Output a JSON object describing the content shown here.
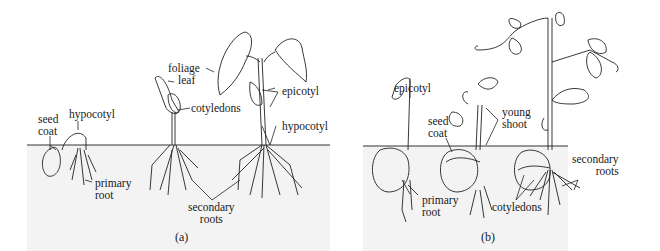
{
  "figure": {
    "panel_a": {
      "caption": "(a)",
      "labels": {
        "seed_coat_1": "seed",
        "seed_coat_2": "coat",
        "hypocotyl_1": "hypocotyl",
        "primary_root_1": "primary",
        "primary_root_2": "root",
        "foliage_leaf_1": "foliage",
        "foliage_leaf_2": "leaf",
        "cotyledons": "cotyledons",
        "epicotyl": "epicotyl",
        "hypocotyl_2": "hypocotyl",
        "secondary_roots_1": "secondary",
        "secondary_roots_2": "roots"
      }
    },
    "panel_b": {
      "caption": "(b)",
      "labels": {
        "epicotyl": "epicotyl",
        "seed_coat_1": "seed",
        "seed_coat_2": "coat",
        "young_shoot_1": "young",
        "young_shoot_2": "shoot",
        "primary_root_1": "primary",
        "primary_root_2": "root",
        "cotyledons": "cotyledons",
        "secondary_roots_1": "secondary",
        "secondary_roots_2": "roots"
      }
    },
    "colors": {
      "ink": "#1a1a1a",
      "soil": "#ececec",
      "background": "#ffffff"
    }
  }
}
